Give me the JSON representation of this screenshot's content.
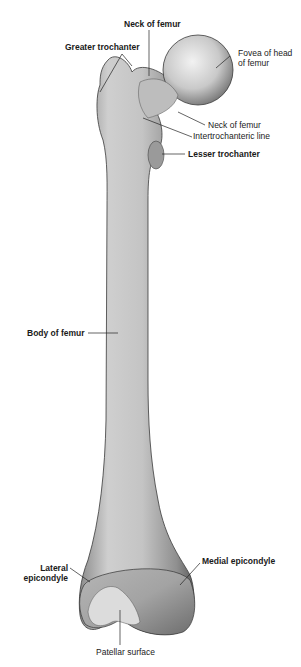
{
  "figure": {
    "labels": {
      "neck_top": "Neck of femur",
      "greater_trochanter": "Greater trochanter",
      "fovea_line1": "Fovea of head",
      "fovea_line2": "of femur",
      "neck_side": "Neck of femur",
      "intertrochanteric_line": "Intertrochanteric line",
      "lesser_trochanter": "Lesser trochanter",
      "body": "Body of femur",
      "lateral_line1": "Lateral",
      "lateral_line2": "epicondyle",
      "medial_epicondyle": "Medial epicondyle",
      "patellar_surface": "Patellar surface"
    }
  }
}
